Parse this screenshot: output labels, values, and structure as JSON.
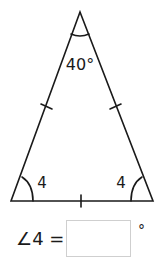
{
  "figure": {
    "type": "isosceles-triangle",
    "apex_angle_label": "40°",
    "base_left_angle_label": "4",
    "base_right_angle_label": "4",
    "equal_side_ticks": 3,
    "stroke_color": "#1a1a1a"
  },
  "question": {
    "label": "∠4 =",
    "input_value": "",
    "input_placeholder": "",
    "unit": "°"
  }
}
